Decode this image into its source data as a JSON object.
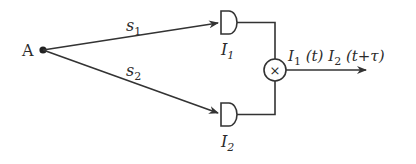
{
  "diagram": {
    "type": "intensity correlation interferometer (HBT) schematic",
    "colors": {
      "stroke": "#333333",
      "text": "#2b2b2b",
      "background": "#ffffff"
    },
    "source": {
      "label": "A"
    },
    "paths": [
      {
        "label": "s",
        "subscript": "1"
      },
      {
        "label": "s",
        "subscript": "2"
      }
    ],
    "detectors": [
      {
        "label": "I",
        "subscript": "1"
      },
      {
        "label": "I",
        "subscript": "2"
      }
    ],
    "multiplier": {
      "symbol": "×"
    },
    "output": {
      "part1": "I",
      "part1_sub": "1",
      "part1_arg": " (t) ",
      "part2": "I",
      "part2_sub": "2",
      "part2_arg": " (t+τ)"
    }
  }
}
